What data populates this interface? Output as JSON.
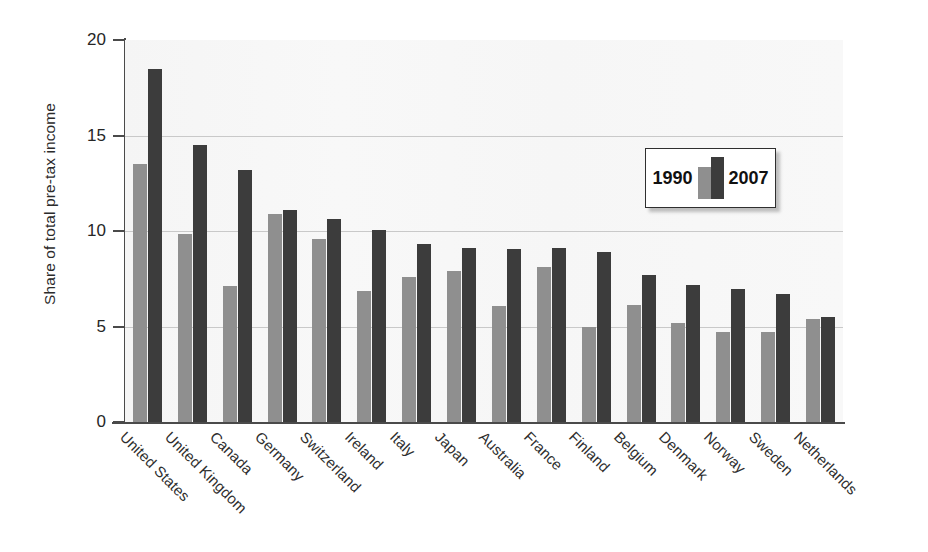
{
  "chart_data": {
    "type": "bar",
    "title": "",
    "xlabel": "",
    "ylabel": "Share of total pre-tax income",
    "ylim": [
      0,
      20
    ],
    "yticks": [
      0,
      5,
      10,
      15,
      20
    ],
    "ytick_labels": [
      "0",
      "5",
      "10",
      "15",
      "20"
    ],
    "gridlines": [
      5,
      10,
      15
    ],
    "grid": true,
    "legend_position": "upper right (inset box)",
    "categories": [
      "United States",
      "United Kingdom",
      "Canada",
      "Germany",
      "Switzerland",
      "Ireland",
      "Italy",
      "Japan",
      "Australia",
      "France",
      "Finland",
      "Belgium",
      "Denmark",
      "Norway",
      "Sweden",
      "Netherlands"
    ],
    "series": [
      {
        "name": "1990",
        "color": "#8f8f8f",
        "values": [
          13.5,
          9.85,
          7.1,
          10.9,
          9.6,
          6.85,
          7.6,
          7.9,
          6.1,
          8.1,
          4.95,
          6.15,
          5.2,
          4.7,
          4.7,
          5.4
        ]
      },
      {
        "name": "2007",
        "color": "#3c3c3c",
        "values": [
          18.5,
          14.5,
          13.2,
          11.1,
          10.65,
          10.05,
          9.3,
          9.1,
          9.05,
          9.1,
          8.9,
          7.7,
          7.15,
          6.95,
          6.7,
          5.5
        ]
      }
    ]
  },
  "legend": {
    "label_1990": "1990",
    "label_2007": "2007"
  },
  "axis": {
    "y_title": "Share of total pre-tax income"
  },
  "colors": {
    "series_1990": "#8f8f8f",
    "series_2007": "#3c3c3c",
    "plot_background": "#f7f7f7",
    "axis": "#4a4a4a",
    "gridline": "#c9c9c9"
  }
}
